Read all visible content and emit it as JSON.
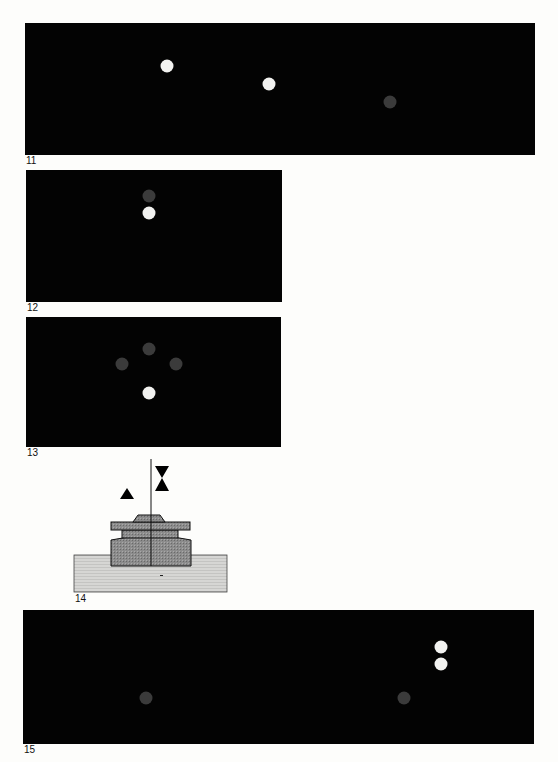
{
  "figures": [
    {
      "label": "11",
      "panel": {
        "x": 25,
        "y": 23,
        "w": 510,
        "h": 132
      },
      "label_pos": {
        "x": 26,
        "y": 156
      },
      "dots": [
        {
          "x": 167,
          "y": 66,
          "color": "white"
        },
        {
          "x": 269,
          "y": 84,
          "color": "white"
        },
        {
          "x": 390,
          "y": 102,
          "color": "grey"
        }
      ]
    },
    {
      "label": "12",
      "panel": {
        "x": 26,
        "y": 170,
        "w": 256,
        "h": 132
      },
      "label_pos": {
        "x": 27,
        "y": 303
      },
      "dots": [
        {
          "x": 149,
          "y": 196,
          "color": "grey"
        },
        {
          "x": 149,
          "y": 213,
          "color": "white"
        }
      ]
    },
    {
      "label": "13",
      "panel": {
        "x": 26,
        "y": 317,
        "w": 255,
        "h": 130
      },
      "label_pos": {
        "x": 27,
        "y": 448
      },
      "dots": [
        {
          "x": 149,
          "y": 349,
          "color": "grey"
        },
        {
          "x": 122,
          "y": 364,
          "color": "grey"
        },
        {
          "x": 176,
          "y": 364,
          "color": "grey"
        },
        {
          "x": 149,
          "y": 393,
          "color": "white"
        }
      ]
    },
    {
      "label": "14",
      "label_pos": {
        "x": 75,
        "y": 594
      },
      "diagram": "cross-section of stacked components on base slab with vertical axis line, triangle marker and hourglass marker"
    },
    {
      "label": "15",
      "panel": {
        "x": 23,
        "y": 610,
        "w": 511,
        "h": 134
      },
      "label_pos": {
        "x": 24,
        "y": 745
      },
      "dots": [
        {
          "x": 441,
          "y": 647,
          "color": "white"
        },
        {
          "x": 441,
          "y": 664,
          "color": "white"
        },
        {
          "x": 146,
          "y": 698,
          "color": "grey"
        },
        {
          "x": 404,
          "y": 698,
          "color": "grey"
        }
      ]
    }
  ],
  "colors": {
    "panel_bg": "#030303",
    "dot_white": "#f2f2f0",
    "dot_grey": "#3b3b3b",
    "page_bg": "#fdfdfb",
    "component_fill": "#8a8a8a",
    "base_fill": "#d2d2d2"
  }
}
